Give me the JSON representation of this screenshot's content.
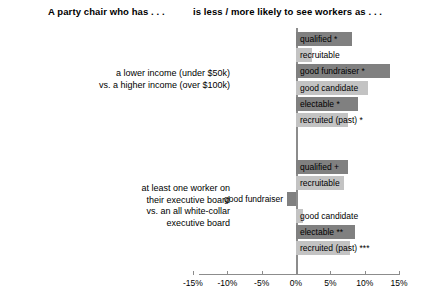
{
  "header": {
    "left": "A party chair who has . . .",
    "right": "is less / more likely to see workers as . . ."
  },
  "axis": {
    "ticks": [
      "-15%",
      "-10%",
      "-5%",
      "0%",
      "5%",
      "10%",
      "15%"
    ],
    "tick_values": [
      -15,
      -10,
      -5,
      0,
      5,
      10,
      15
    ],
    "xmin": -15,
    "xmax": 15
  },
  "colors": {
    "bar_dark": "#808080",
    "bar_light": "#c3c3c3",
    "axis": "#8c8c8c",
    "text": "#000000"
  },
  "groups": [
    {
      "description": "a lower income (under $50k)\nvs. a higher income (over $100k)",
      "bars": [
        {
          "label": "qualified *",
          "value": 8.2,
          "shade": "dark"
        },
        {
          "label": "recruitable",
          "value": 2.3,
          "shade": "light"
        },
        {
          "label": "good fundraiser *",
          "value": 13.7,
          "shade": "dark"
        },
        {
          "label": "good candidate",
          "value": 10.5,
          "shade": "light"
        },
        {
          "label": "electable *",
          "value": 9.0,
          "shade": "dark"
        },
        {
          "label": "recruited (past) *",
          "value": 7.5,
          "shade": "light"
        }
      ]
    },
    {
      "description": "at least one worker on\ntheir executive board\nvs. an all white-collar\nexecutive board",
      "bars": [
        {
          "label": "qualified +",
          "value": 7.5,
          "shade": "dark"
        },
        {
          "label": "recruitable",
          "value": 7.0,
          "shade": "light"
        },
        {
          "label": "good fundraiser",
          "value": -1.3,
          "shade": "dark"
        },
        {
          "label": "good candidate",
          "value": 1.0,
          "shade": "light"
        },
        {
          "label": "electable **",
          "value": 8.6,
          "shade": "dark"
        },
        {
          "label": "recruited (past) ***",
          "value": 7.8,
          "shade": "light"
        }
      ]
    }
  ],
  "chart_data": {
    "type": "bar",
    "orientation": "horizontal",
    "title": "",
    "xlabel": "",
    "ylabel": "",
    "xlim": [
      -15,
      15
    ],
    "grid": false,
    "legend": "none",
    "column_header_left": "A party chair who has . . .",
    "column_header_right": "is less / more likely to see workers as . . .",
    "xtick_labels": [
      "-15%",
      "-10%",
      "-5%",
      "0%",
      "5%",
      "10%",
      "15%"
    ],
    "xticks": [
      -15,
      -10,
      -5,
      0,
      5,
      10,
      15
    ],
    "groups": [
      {
        "name": "a lower income (under $50k) vs. a higher income (over $100k)",
        "categories": [
          "qualified *",
          "recruitable",
          "good fundraiser *",
          "good candidate",
          "electable *",
          "recruited (past) *"
        ],
        "values": [
          8.2,
          2.3,
          13.7,
          10.5,
          9.0,
          7.5
        ]
      },
      {
        "name": "at least one worker on their executive board vs. an all white-collar executive board",
        "categories": [
          "qualified +",
          "recruitable",
          "good fundraiser",
          "good candidate",
          "electable **",
          "recruited (past) ***"
        ],
        "values": [
          7.5,
          7.0,
          -1.3,
          1.0,
          8.6,
          7.8
        ]
      }
    ]
  }
}
